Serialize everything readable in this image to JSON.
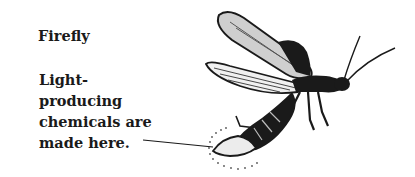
{
  "diagram": {
    "title": "Firefly",
    "label_lines": [
      "Light-",
      "producing",
      "chemicals are",
      "made here."
    ],
    "parts": [
      "wing",
      "hind-wing",
      "body",
      "antennae",
      "legs",
      "light-organ",
      "light-glow"
    ],
    "colors": {
      "ink": "#1a1a1a",
      "background": "#ffffff"
    }
  }
}
